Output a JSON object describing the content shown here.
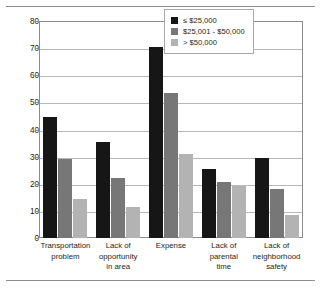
{
  "chart_data": {
    "type": "bar",
    "title": "",
    "subtitle": "",
    "xlabel": "",
    "ylabel": "Percent reporting barriers",
    "ylim": [
      0,
      80
    ],
    "ytick_step": 10,
    "yticks": [
      "80",
      "70",
      "60",
      "50",
      "40",
      "30",
      "20",
      "10",
      "0"
    ],
    "grid": true,
    "legend_position": "top-right",
    "categories": [
      "Transportation problem",
      "Lack of opportunity in area",
      "Expense",
      "Lack of parental time",
      "Lack of neighborhood safety"
    ],
    "category_lines": [
      [
        "Transportation",
        "problem"
      ],
      [
        "Lack of",
        "opportunity",
        "in area"
      ],
      [
        "Expense"
      ],
      [
        "Lack of",
        "parental",
        "time"
      ],
      [
        "Lack of",
        "neighborhood",
        "safety"
      ]
    ],
    "series": [
      {
        "name": "≤ $25,000",
        "color": "#161616",
        "values": [
          44.5,
          35.5,
          70.5,
          25.5,
          29.5
        ]
      },
      {
        "name": "$25,001 - $50,000",
        "color": "#777777",
        "values": [
          29.0,
          22.0,
          53.5,
          20.5,
          18.0
        ]
      },
      {
        "name": "> $50,000",
        "color": "#b3b3b3",
        "values": [
          14.5,
          11.5,
          31.0,
          19.0,
          8.5
        ]
      }
    ]
  },
  "legend": {
    "items": [
      {
        "label": "≤ $25,000",
        "swatch": "black-swatch"
      },
      {
        "label": "$25,001 - $50,000",
        "swatch": "dark-gray-swatch"
      },
      {
        "label": "> $50,000",
        "swatch": "light-gray-swatch"
      }
    ]
  },
  "colors": {
    "series_low_income": "#161616",
    "series_mid_income": "#777777",
    "series_high_income": "#b3b3b3",
    "axis": "#8c8c8c",
    "gridline": "#b8b8b8",
    "text": "#231f20"
  }
}
